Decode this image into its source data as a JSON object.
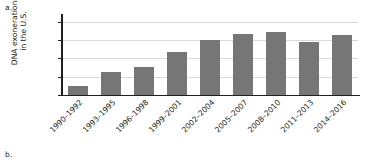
{
  "panels": {
    "top_letter": "a.",
    "bottom_letter": "b."
  },
  "chart_data": {
    "type": "bar",
    "title": "",
    "xlabel": "",
    "ylabel": "DNA exonerations in the U.S.",
    "ylabel_line1": "DNA exonerations",
    "ylabel_line2": "in the U.S.",
    "ylim": [
      0,
      85
    ],
    "yticks": [
      0,
      20,
      40,
      60,
      80
    ],
    "ytick_labels": [
      "0",
      "20",
      "40",
      "60",
      "80"
    ],
    "grid": true,
    "grid_axis": "y",
    "legend": false,
    "bar_color": "#767676",
    "axis_color": "#231f20",
    "gridline_color": "#d9d9d9",
    "categories": [
      "1990–1992",
      "1993–1995",
      "1996–1998",
      "1999–2001",
      "2002–2004",
      "2005–2007",
      "2008–2010",
      "2011–2013",
      "2014–2016"
    ],
    "values": [
      10,
      25,
      30,
      47,
      60,
      66,
      69,
      58,
      65
    ]
  }
}
